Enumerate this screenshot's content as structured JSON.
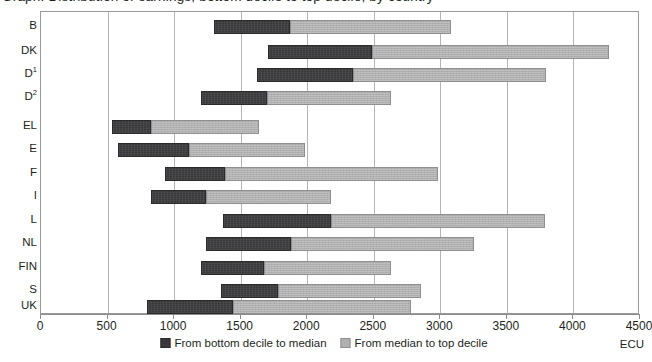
{
  "title": "Graph: Distribution of earnings, bottom decile to top decile, by country",
  "unit_label": "ECU",
  "colors": {
    "low_segment": "#3a3a3c",
    "high_segment": "#b0b0b0",
    "gridline": "#b4b4b4",
    "frame": "#9a9a9a",
    "text": "#231f20"
  },
  "legend": {
    "position": "bottom-center",
    "items": [
      {
        "label": "From bottom decile to median",
        "swatch": "low"
      },
      {
        "label": "From median to top decile",
        "swatch": "high"
      }
    ]
  },
  "axis": {
    "x_tick_labels": [
      "0",
      "500",
      "1000",
      "1500",
      "2000",
      "2500",
      "3000",
      "3500",
      "4000",
      "4500"
    ],
    "x_tick_values": [
      0,
      500,
      1000,
      1500,
      2000,
      2500,
      3000,
      3500,
      4000,
      4500
    ]
  },
  "chart_data": {
    "type": "bar",
    "orientation": "horizontal",
    "subtype": "floating-stacked-range",
    "title": "Graph: Distribution of earnings, bottom decile to top decile, by country",
    "xlabel": "ECU",
    "ylabel": "",
    "xlim": [
      0,
      4500
    ],
    "grid": true,
    "grid_axis": "x",
    "legend_position": "bottom-center",
    "categories": [
      "B",
      "DK",
      "D1",
      "D2",
      "EL",
      "E",
      "F",
      "I",
      "L",
      "NL",
      "FIN",
      "S",
      "UK"
    ],
    "category_labels": [
      "B",
      "DK",
      "D¹",
      "D²",
      "EL",
      "E",
      "F",
      "I",
      "L",
      "NL",
      "FIN",
      "S",
      "UK"
    ],
    "series": [
      {
        "name": "From bottom decile to median",
        "color": "#3a3a3c",
        "values": [
          570,
          780,
          725,
          500,
          300,
          530,
          450,
          410,
          810,
          640,
          475,
          430,
          640
        ]
      },
      {
        "name": "From median to top decile",
        "color": "#b0b0b0",
        "values": [
          1210,
          1780,
          1450,
          930,
          810,
          870,
          1600,
          940,
          1610,
          1370,
          955,
          1075,
          1340
        ]
      }
    ],
    "points": [
      {
        "category": "B",
        "bottom_decile": 1300,
        "median": 1870,
        "top_decile": 3080
      },
      {
        "category": "D1",
        "bottom_decile": 1620,
        "median": 2345,
        "top_decile": 3795
      },
      {
        "category": "DK",
        "bottom_decile": 1705,
        "median": 2485,
        "top_decile": 4265
      },
      {
        "category": "D2",
        "bottom_decile": 1200,
        "median": 1700,
        "top_decile": 2630
      },
      {
        "category": "EL",
        "bottom_decile": 530,
        "median": 830,
        "top_decile": 1640
      },
      {
        "category": "E",
        "bottom_decile": 580,
        "median": 1110,
        "top_decile": 1980
      },
      {
        "category": "F",
        "bottom_decile": 930,
        "median": 1380,
        "top_decile": 2980
      },
      {
        "category": "I",
        "bottom_decile": 830,
        "median": 1240,
        "top_decile": 2180
      },
      {
        "category": "L",
        "bottom_decile": 1370,
        "median": 2180,
        "top_decile": 3790
      },
      {
        "category": "NL",
        "bottom_decile": 1240,
        "median": 1880,
        "top_decile": 3250
      },
      {
        "category": "FIN",
        "bottom_decile": 1200,
        "median": 1675,
        "top_decile": 2630
      },
      {
        "category": "S",
        "bottom_decile": 1350,
        "median": 1780,
        "top_decile": 2855
      },
      {
        "category": "UK",
        "bottom_decile": 800,
        "median": 1440,
        "top_decile": 2780
      }
    ]
  }
}
